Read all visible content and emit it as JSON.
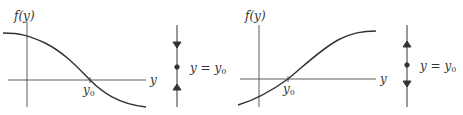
{
  "diagrams": [
    {
      "id": "decreasing",
      "ylabel": "f(y)",
      "xlabel": "y",
      "root_label": "y",
      "root_sub": "0",
      "phase_label_lhs": "y = y",
      "phase_label_sub": "0",
      "curve": "decreasing sigmoid crossing axis at y0",
      "arrows": [
        "down",
        "up"
      ],
      "stability": "stable"
    },
    {
      "id": "increasing",
      "ylabel": "f(y)",
      "xlabel": "y",
      "root_label": "y",
      "root_sub": "0",
      "phase_label_lhs": "y = y",
      "phase_label_sub": "0",
      "curve": "increasing sigmoid crossing axis at y0",
      "arrows": [
        "up",
        "down"
      ],
      "stability": "unstable"
    }
  ],
  "colors": {
    "line": "#333333",
    "background": "#ffffff"
  }
}
